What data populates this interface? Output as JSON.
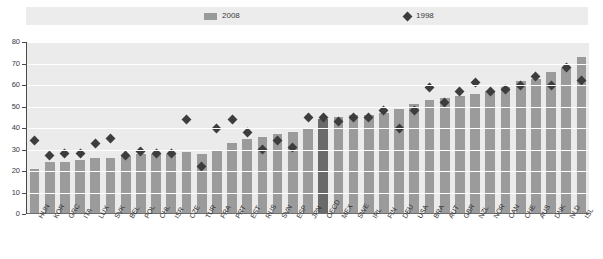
{
  "legend": {
    "series": [
      {
        "key": "bars",
        "label": "2008",
        "marker": "bar-swatch-icon",
        "color": "#9b9b9b"
      },
      {
        "key": "points",
        "label": "1998",
        "marker": "diamond-marker-icon",
        "color": "#3d3d3d"
      }
    ]
  },
  "axis": {
    "y_ticks": [
      "80",
      "70",
      "60",
      "50",
      "40",
      "30",
      "20",
      "10",
      "0"
    ],
    "y_min": 0,
    "y_max": 80
  },
  "chart_data": {
    "type": "bar",
    "title": "",
    "xlabel": "",
    "ylabel": "",
    "ylim": [
      0,
      80
    ],
    "grid": true,
    "legend_position": "top",
    "highlight_category": "OECD",
    "categories": [
      "HUN",
      "KOR",
      "GRC",
      "ITA",
      "LUX",
      "SVK",
      "BEL",
      "POL",
      "CHL",
      "ISR",
      "CZE",
      "TUR",
      "FRA",
      "PRT",
      "EST",
      "RUS",
      "SVN",
      "ESP",
      "JPN",
      "OECD",
      "MEX",
      "SWE",
      "IRL",
      "FIN",
      "DEU",
      "USA",
      "BRA",
      "AUT",
      "GBR",
      "NZL",
      "NOR",
      "CAN",
      "CHE",
      "AUS",
      "DNK",
      "NLD",
      "ISL"
    ],
    "series": [
      {
        "name": "2008",
        "type": "bar",
        "color": "#9b9b9b",
        "values": [
          21,
          24,
          24,
          25,
          26,
          26,
          27,
          28,
          28,
          28,
          29,
          28,
          30,
          33,
          35,
          36,
          37,
          38,
          40,
          44,
          45,
          46,
          46,
          47,
          49,
          51,
          53,
          54,
          55,
          56,
          57,
          59,
          62,
          63,
          66,
          68,
          73
        ]
      },
      {
        "name": "1998",
        "type": "scatter",
        "color": "#3d3d3d",
        "marker": "diamond",
        "values": [
          34,
          27,
          28,
          28,
          33,
          35,
          27,
          29,
          28,
          28,
          44,
          22,
          40,
          44,
          38,
          30,
          34,
          31,
          45,
          45,
          43,
          45,
          45,
          48,
          40,
          48,
          59,
          52,
          57,
          61,
          57,
          58,
          60,
          64,
          60,
          68,
          62
        ]
      }
    ]
  }
}
